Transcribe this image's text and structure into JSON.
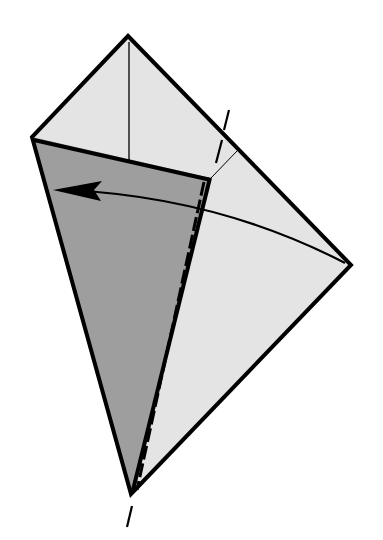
{
  "diagram": {
    "type": "origami-fold-step",
    "colors": {
      "paper_light": "#e4e4e4",
      "paper_dark": "#9e9e9e",
      "outline": "#000000",
      "background": "#ffffff"
    },
    "vertices": {
      "top": [
        128,
        36
      ],
      "left": [
        32,
        137
      ],
      "right": [
        351,
        265
      ],
      "bottom": [
        131,
        494
      ],
      "flap_corner": [
        211,
        178
      ],
      "inner_crease_end": [
        236,
        152
      ]
    },
    "elements": [
      {
        "name": "light-face",
        "description": "Light gray kite-shaped paper face"
      },
      {
        "name": "dark-flap",
        "description": "Dark gray folded flap on left side"
      },
      {
        "name": "center-crease",
        "description": "Thin vertical crease from top point"
      },
      {
        "name": "valley-fold-line",
        "description": "Dashed valley fold line from top-right edge to bottom point"
      },
      {
        "name": "fold-arrow",
        "description": "Curved arrow from right point pointing left across flap"
      }
    ]
  }
}
